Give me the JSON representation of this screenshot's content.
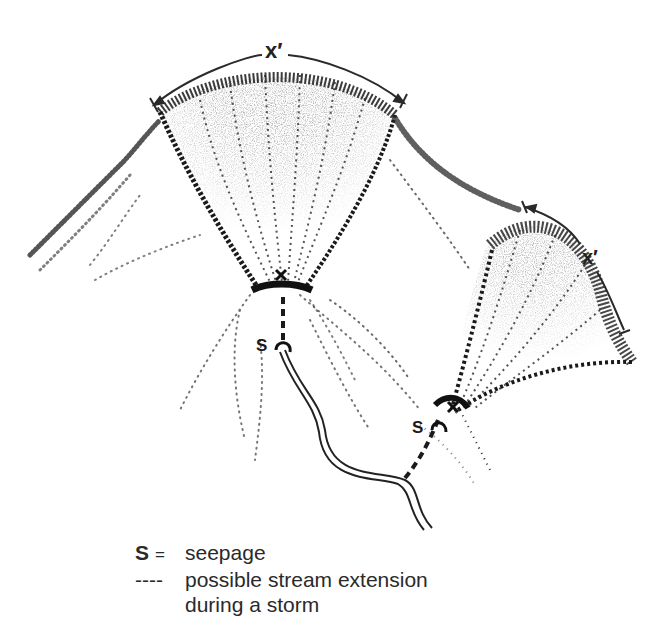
{
  "diagram": {
    "width_labels": [
      {
        "id": "upper-hollow-width",
        "text": "x′"
      },
      {
        "id": "right-hollow-width",
        "text": "x′"
      }
    ],
    "seepage_markers": [
      {
        "id": "seepage-left",
        "text": "S"
      },
      {
        "id": "seepage-right",
        "text": "S"
      }
    ],
    "colors": {
      "ink": "#1e1e1e",
      "stipple": "#333333",
      "background": "#ffffff"
    }
  },
  "legend": {
    "items": [
      {
        "symbol": "S",
        "separator": "=",
        "label": "seepage"
      },
      {
        "symbol": "----",
        "label_line1": "possible stream extension",
        "label_line2": "during a storm"
      }
    ]
  }
}
